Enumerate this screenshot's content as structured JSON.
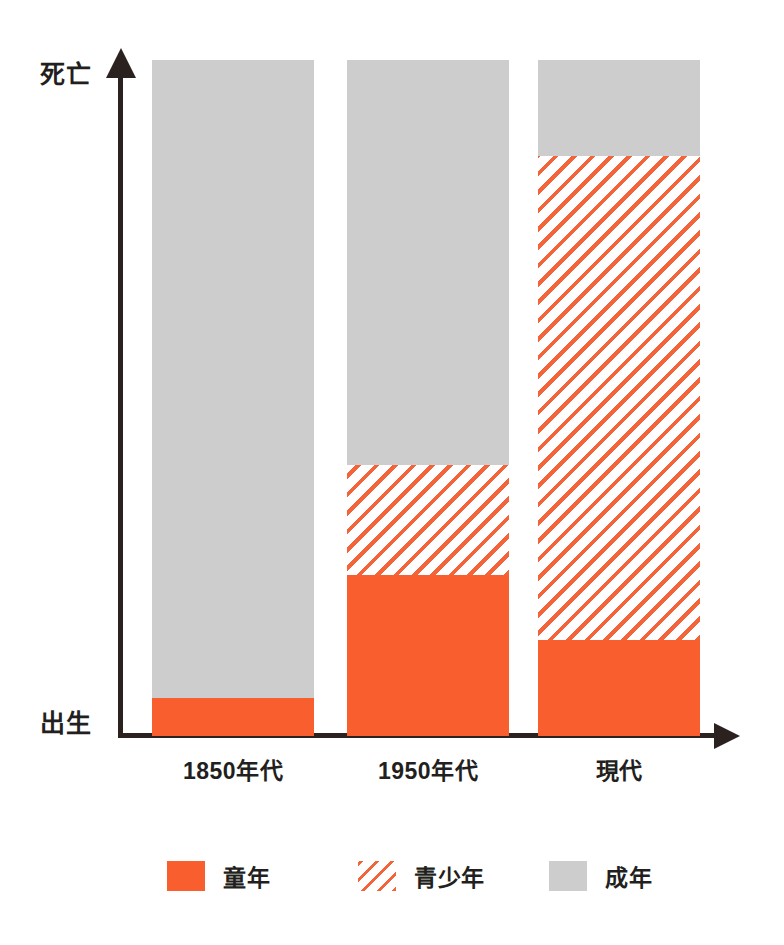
{
  "chart_data": {
    "type": "bar",
    "title": "",
    "subtitle": "",
    "stacked": true,
    "orientation": "vertical",
    "xlabel": "",
    "ylabel": "",
    "grid": false,
    "legend_position": "bottom",
    "axis_labels": {
      "y_top": "死亡",
      "y_bottom": "出生",
      "y_axis_arrow": "up-arrow",
      "x_axis_arrow": "right-arrow"
    },
    "categories": [
      "1850年代",
      "1950年代",
      "現代"
    ],
    "series": [
      {
        "name": "童年",
        "key": "childhood",
        "style": "solid-orange",
        "color": "#F95F2E",
        "values": [
          5.6,
          23.8,
          14.2
        ]
      },
      {
        "name": "青少年",
        "key": "adolescence",
        "style": "hatched-orange",
        "color": "#F4643A",
        "values": [
          0.0,
          16.3,
          71.6
        ]
      },
      {
        "name": "成年",
        "key": "adulthood",
        "style": "solid-gray",
        "color": "#CDCDCD",
        "values": [
          94.4,
          59.9,
          14.2
        ]
      }
    ],
    "ylim": [
      0,
      100
    ],
    "units": "percent of lifespan",
    "legend": [
      {
        "label": "童年",
        "swatch": "solid-orange"
      },
      {
        "label": "青少年",
        "swatch": "hatched-orange"
      },
      {
        "label": "成年",
        "swatch": "solid-gray"
      }
    ],
    "colors": {
      "orange": "#F95F2E",
      "hatch_orange": "#F4643A",
      "gray": "#CDCDCD",
      "axis": "#2B2220",
      "text": "#231F20",
      "background": "#FFFFFF"
    }
  }
}
